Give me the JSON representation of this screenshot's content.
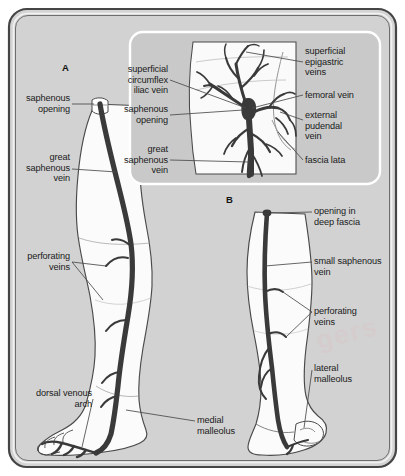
{
  "figure": {
    "background_color": "#ffffff",
    "frame_fill": "#d4d4d4",
    "frame_stroke": "#3d3d3d",
    "vein_color": "#3a3a3a",
    "skin_fill": "#fbfbfb",
    "inset_fill": "#c9c9c9",
    "inset_stroke": "#ffffff",
    "label_color": "#1a1a1a",
    "watermark": "gers"
  },
  "panels": [
    {
      "id": "A",
      "letter": "A"
    },
    {
      "id": "B",
      "letter": "B"
    }
  ],
  "inset": {
    "labels_left": [
      {
        "key": "superficial-circumflex-iliac-vein",
        "text": "superficial\ncircumflex\niliac vein"
      },
      {
        "key": "saphenous-opening",
        "text": "saphenous\nopening"
      },
      {
        "key": "great-saphenous-vein",
        "text": "great\nsaphenous\nvein"
      }
    ],
    "labels_right": [
      {
        "key": "superficial-epigastric-veins",
        "text": "superficial\nepigastric\nveins"
      },
      {
        "key": "femoral-vein",
        "text": "femoral vein"
      },
      {
        "key": "external-pudendal-vein",
        "text": "external\npudendal\nvein"
      },
      {
        "key": "fascia-lata",
        "text": "fascia lata"
      }
    ]
  },
  "panel_a": {
    "labels_left": [
      {
        "key": "saphenous-opening",
        "text": "saphenous\nopening"
      },
      {
        "key": "great-saphenous-vein",
        "text": "great\nsaphenous\nvein"
      },
      {
        "key": "perforating-veins",
        "text": "perforating\nveins"
      },
      {
        "key": "dorsal-venous-arch",
        "text": "dorsal venous\narch"
      }
    ],
    "labels_right": [
      {
        "key": "medial-malleolus",
        "text": "medial\nmalleolus"
      }
    ]
  },
  "panel_b": {
    "labels_right": [
      {
        "key": "opening-in-deep-fascia",
        "text": "opening in\ndeep fascia"
      },
      {
        "key": "small-saphenous-vein",
        "text": "small saphenous\nvein"
      },
      {
        "key": "perforating-veins",
        "text": "perforating\nveins"
      },
      {
        "key": "lateral-malleolus",
        "text": "lateral\nmalleolus"
      }
    ]
  }
}
